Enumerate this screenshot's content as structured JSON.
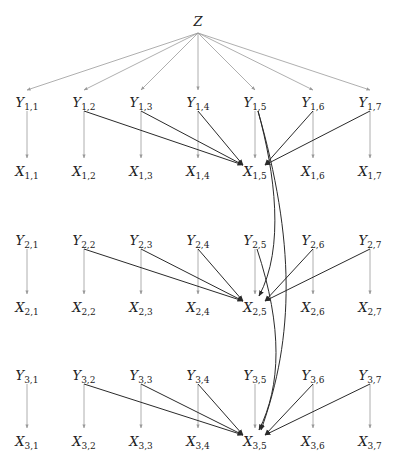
{
  "diagram": {
    "type": "directed-graph",
    "root": {
      "id": "Z",
      "label": "Z",
      "x": 198,
      "y": 22
    },
    "columns_x": [
      27,
      84,
      141,
      198,
      255,
      313,
      370
    ],
    "rows": [
      {
        "index": 1,
        "y_label_y": 103,
        "x_label_y": 172
      },
      {
        "index": 2,
        "y_label_y": 241,
        "x_label_y": 308
      },
      {
        "index": 3,
        "y_label_y": 376,
        "x_label_y": 442
      }
    ],
    "target_column": 5,
    "colors": {
      "light_edge": "#9a9a9a",
      "dark_edge": "#2a2a2a",
      "text": "#222222",
      "background": "#ffffff"
    },
    "nodes": [
      {
        "id": "Y1,1",
        "base": "Y",
        "sub": "1,1"
      },
      {
        "id": "Y1,2",
        "base": "Y",
        "sub": "1,2"
      },
      {
        "id": "Y1,3",
        "base": "Y",
        "sub": "1,3"
      },
      {
        "id": "Y1,4",
        "base": "Y",
        "sub": "1,4"
      },
      {
        "id": "Y1,5",
        "base": "Y",
        "sub": "1,5"
      },
      {
        "id": "Y1,6",
        "base": "Y",
        "sub": "1,6"
      },
      {
        "id": "Y1,7",
        "base": "Y",
        "sub": "1,7"
      },
      {
        "id": "X1,1",
        "base": "X",
        "sub": "1,1"
      },
      {
        "id": "X1,2",
        "base": "X",
        "sub": "1,2"
      },
      {
        "id": "X1,3",
        "base": "X",
        "sub": "1,3"
      },
      {
        "id": "X1,4",
        "base": "X",
        "sub": "1,4"
      },
      {
        "id": "X1,5",
        "base": "X",
        "sub": "1,5"
      },
      {
        "id": "X1,6",
        "base": "X",
        "sub": "1,6"
      },
      {
        "id": "X1,7",
        "base": "X",
        "sub": "1,7"
      },
      {
        "id": "Y2,1",
        "base": "Y",
        "sub": "2,1"
      },
      {
        "id": "Y2,2",
        "base": "Y",
        "sub": "2,2"
      },
      {
        "id": "Y2,3",
        "base": "Y",
        "sub": "2,3"
      },
      {
        "id": "Y2,4",
        "base": "Y",
        "sub": "2,4"
      },
      {
        "id": "Y2,5",
        "base": "Y",
        "sub": "2,5"
      },
      {
        "id": "Y2,6",
        "base": "Y",
        "sub": "2,6"
      },
      {
        "id": "Y2,7",
        "base": "Y",
        "sub": "2,7"
      },
      {
        "id": "X2,1",
        "base": "X",
        "sub": "2,1"
      },
      {
        "id": "X2,2",
        "base": "X",
        "sub": "2,2"
      },
      {
        "id": "X2,3",
        "base": "X",
        "sub": "2,3"
      },
      {
        "id": "X2,4",
        "base": "X",
        "sub": "2,4"
      },
      {
        "id": "X2,5",
        "base": "X",
        "sub": "2,5"
      },
      {
        "id": "X2,6",
        "base": "X",
        "sub": "2,6"
      },
      {
        "id": "X2,7",
        "base": "X",
        "sub": "2,7"
      },
      {
        "id": "Y3,1",
        "base": "Y",
        "sub": "3,1"
      },
      {
        "id": "Y3,2",
        "base": "Y",
        "sub": "3,2"
      },
      {
        "id": "Y3,3",
        "base": "Y",
        "sub": "3,3"
      },
      {
        "id": "Y3,4",
        "base": "Y",
        "sub": "3,4"
      },
      {
        "id": "Y3,5",
        "base": "Y",
        "sub": "3,5"
      },
      {
        "id": "Y3,6",
        "base": "Y",
        "sub": "3,6"
      },
      {
        "id": "Y3,7",
        "base": "Y",
        "sub": "3,7"
      },
      {
        "id": "X3,1",
        "base": "X",
        "sub": "3,1"
      },
      {
        "id": "X3,2",
        "base": "X",
        "sub": "3,2"
      },
      {
        "id": "X3,3",
        "base": "X",
        "sub": "3,3"
      },
      {
        "id": "X3,4",
        "base": "X",
        "sub": "3,4"
      },
      {
        "id": "X3,5",
        "base": "X",
        "sub": "3,5"
      },
      {
        "id": "X3,6",
        "base": "X",
        "sub": "3,6"
      },
      {
        "id": "X3,7",
        "base": "X",
        "sub": "3,7"
      }
    ],
    "edges": {
      "root_to_y1": [
        "Y1,1",
        "Y1,2",
        "Y1,3",
        "Y1,4",
        "Y1,5",
        "Y1,6",
        "Y1,7"
      ],
      "vertical": "Yi,j -> Xi,j for all i,j",
      "to_target": "Yi,j -> Xi,5 for j in 2,3,4,6,7",
      "cross_row": [
        {
          "from": "Y1,5",
          "to": "X2,5"
        },
        {
          "from": "Y1,5",
          "to": "X3,5"
        },
        {
          "from": "Y2,5",
          "to": "X3,5"
        }
      ]
    }
  }
}
